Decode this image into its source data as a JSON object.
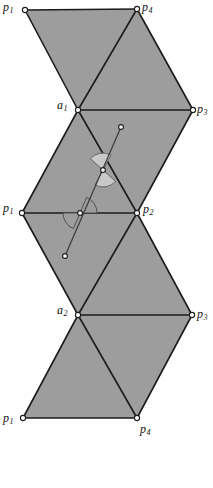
{
  "figure": {
    "background_color": "#ffffff",
    "fill_color": "#9d9d9d",
    "edge_color": "#1b1b1b",
    "width": 213,
    "height": 488
  },
  "labels": [
    {
      "name": "label-p1-top",
      "base": "p",
      "sub": "1",
      "x": 3,
      "y": 1
    },
    {
      "name": "label-p4-top",
      "base": "p",
      "sub": "4",
      "x": 142,
      "y": 1
    },
    {
      "name": "label-a1",
      "base": "a",
      "sub": "1",
      "x": 57,
      "y": 99
    },
    {
      "name": "label-p3-upper",
      "base": "p",
      "sub": "3",
      "x": 197,
      "y": 103
    },
    {
      "name": "label-p1-mid",
      "base": "p",
      "sub": "1",
      "x": 3,
      "y": 202
    },
    {
      "name": "label-p2-mid",
      "base": "p",
      "sub": "2",
      "x": 143,
      "y": 203
    },
    {
      "name": "label-a2",
      "base": "a",
      "sub": "2",
      "x": 57,
      "y": 304
    },
    {
      "name": "label-p3-lower",
      "base": "p",
      "sub": "3",
      "x": 197,
      "y": 308
    },
    {
      "name": "label-p1-bottom",
      "base": "p",
      "sub": "1",
      "x": 3,
      "y": 412
    },
    {
      "name": "label-p4-bottom",
      "base": "p",
      "sub": "4",
      "x": 140,
      "y": 423
    }
  ],
  "vertices": [
    {
      "name": "vertex-p1-top",
      "x": 25,
      "y": 10
    },
    {
      "name": "vertex-p4-top",
      "x": 137,
      "y": 9
    },
    {
      "name": "vertex-a1",
      "x": 78,
      "y": 110
    },
    {
      "name": "vertex-p3-upper",
      "x": 193,
      "y": 110
    },
    {
      "name": "vertex-p1-mid",
      "x": 22,
      "y": 213
    },
    {
      "name": "vertex-p2-mid",
      "x": 137,
      "y": 213
    },
    {
      "name": "vertex-a2",
      "x": 78,
      "y": 315
    },
    {
      "name": "vertex-p3-lower",
      "x": 192,
      "y": 315
    },
    {
      "name": "vertex-p1-bottom",
      "x": 23,
      "y": 418
    },
    {
      "name": "vertex-p4-bottom",
      "x": 137,
      "y": 418
    }
  ],
  "faces": [
    {
      "name": "face-upper-left",
      "points": "25,10 137,9 78,110"
    },
    {
      "name": "face-upper-right",
      "points": "137,9 193,110 78,110"
    },
    {
      "name": "face-middle-upper-left",
      "points": "78,110 22,213 137,213"
    },
    {
      "name": "face-middle-upper-right",
      "points": "78,110 193,110 137,213"
    },
    {
      "name": "face-middle-lower-left",
      "points": "22,213 137,213 78,315"
    },
    {
      "name": "face-middle-lower-right",
      "points": "137,213 192,315 78,315"
    },
    {
      "name": "face-lower-left",
      "points": "78,315 23,418 137,418"
    },
    {
      "name": "face-lower-right",
      "points": "78,315 192,315 137,418"
    }
  ],
  "edges": [
    {
      "name": "edge-top-p1-p4",
      "x1": 25,
      "y1": 10,
      "x2": 137,
      "y2": 9
    },
    {
      "name": "edge-p1top-a1",
      "x1": 25,
      "y1": 10,
      "x2": 78,
      "y2": 110
    },
    {
      "name": "edge-p4top-a1",
      "x1": 137,
      "y1": 9,
      "x2": 78,
      "y2": 110
    },
    {
      "name": "edge-p4top-p3upper",
      "x1": 137,
      "y1": 9,
      "x2": 193,
      "y2": 110
    },
    {
      "name": "edge-a1-p3upper",
      "x1": 78,
      "y1": 110,
      "x2": 193,
      "y2": 110
    },
    {
      "name": "edge-a1-p1mid",
      "x1": 78,
      "y1": 110,
      "x2": 22,
      "y2": 213
    },
    {
      "name": "edge-a1-p2mid",
      "x1": 78,
      "y1": 110,
      "x2": 137,
      "y2": 213
    },
    {
      "name": "edge-p3upper-p2mid",
      "x1": 193,
      "y1": 110,
      "x2": 137,
      "y2": 213
    },
    {
      "name": "edge-p1mid-p2mid",
      "x1": 22,
      "y1": 213,
      "x2": 137,
      "y2": 213
    },
    {
      "name": "edge-p1mid-a2",
      "x1": 22,
      "y1": 213,
      "x2": 78,
      "y2": 315
    },
    {
      "name": "edge-p2mid-a2",
      "x1": 137,
      "y1": 213,
      "x2": 78,
      "y2": 315
    },
    {
      "name": "edge-p2mid-p3lower",
      "x1": 137,
      "y1": 213,
      "x2": 192,
      "y2": 315
    },
    {
      "name": "edge-a2-p3lower",
      "x1": 78,
      "y1": 315,
      "x2": 192,
      "y2": 315
    },
    {
      "name": "edge-a2-p1bottom",
      "x1": 78,
      "y1": 315,
      "x2": 23,
      "y2": 418
    },
    {
      "name": "edge-a2-p4bottom",
      "x1": 78,
      "y1": 315,
      "x2": 137,
      "y2": 418
    },
    {
      "name": "edge-p3lower-p4bottom",
      "x1": 192,
      "y1": 315,
      "x2": 137,
      "y2": 418
    },
    {
      "name": "edge-bottom-p1-p4",
      "x1": 23,
      "y1": 418,
      "x2": 137,
      "y2": 418
    }
  ],
  "transversal": {
    "name": "transversal-segment",
    "x1": 121,
    "y1": 127,
    "x2": 65,
    "y2": 256,
    "endpoint_upper": {
      "x": 121,
      "y": 127
    },
    "endpoint_lower": {
      "x": 65,
      "y": 256
    },
    "crossing_upper": {
      "x": 103,
      "y": 170
    },
    "crossing_lower": {
      "x": 80,
      "y": 213
    }
  },
  "angle_marks": [
    {
      "name": "angle-mark-upper-above",
      "cx": 103,
      "cy": 170,
      "r": 17,
      "start": 222,
      "end": 298,
      "tone": "light"
    },
    {
      "name": "angle-mark-upper-below",
      "cx": 103,
      "cy": 170,
      "r": 17,
      "start": 42,
      "end": 118,
      "tone": "light"
    },
    {
      "name": "angle-mark-lower-right",
      "cx": 80,
      "cy": 213,
      "r": 17,
      "start": 293,
      "end": 360,
      "tone": "dark"
    },
    {
      "name": "angle-mark-lower-left",
      "cx": 80,
      "cy": 213,
      "r": 17,
      "start": 113,
      "end": 180,
      "tone": "dark"
    }
  ]
}
